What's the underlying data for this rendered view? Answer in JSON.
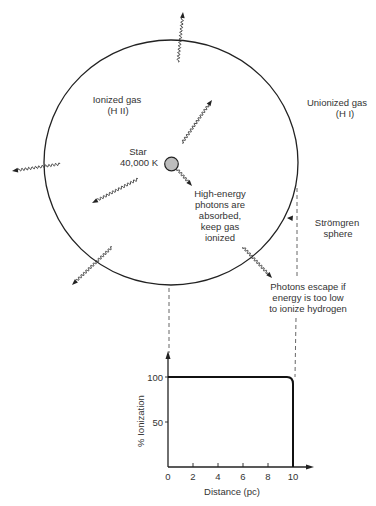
{
  "diagram": {
    "labels": {
      "ionized_gas": "Ionized gas",
      "ionized_gas_symbol": "(H II)",
      "unionized_gas": "Unionized gas",
      "unionized_gas_symbol": "(H I)",
      "star": "Star",
      "star_temperature": "40,000 K",
      "absorbed_note": [
        "High-energy",
        "photons are",
        "absorbed,",
        "keep gas",
        "ionized"
      ],
      "stromgren": [
        "Strömgren",
        "sphere"
      ],
      "escape_note": [
        "Photons escape if",
        "energy is too low",
        "to ionize hydrogen"
      ]
    },
    "colors": {
      "ink": "#222222",
      "star_fill": "#bdbdbd",
      "background": "#ffffff"
    }
  },
  "chart": {
    "ylabel": "% Ionization",
    "xlabel": "Distance (pc)",
    "y_ticks": [
      "100",
      "50"
    ],
    "x_ticks": [
      "0",
      "2",
      "4",
      "6",
      "8",
      "10"
    ]
  },
  "chart_data": {
    "type": "line",
    "title": "",
    "xlabel": "Distance (pc)",
    "ylabel": "% Ionization",
    "x": [
      0,
      2,
      4,
      6,
      8,
      9.6,
      10,
      10
    ],
    "series": [
      {
        "name": "Ionization fraction",
        "values": [
          100,
          100,
          100,
          100,
          100,
          100,
          95,
          0
        ]
      }
    ],
    "x_ticks": [
      0,
      2,
      4,
      6,
      8,
      10
    ],
    "y_ticks": [
      50,
      100
    ],
    "xlim": [
      0,
      11.5
    ],
    "ylim": [
      0,
      120
    ],
    "grid": false,
    "legend": "none"
  }
}
